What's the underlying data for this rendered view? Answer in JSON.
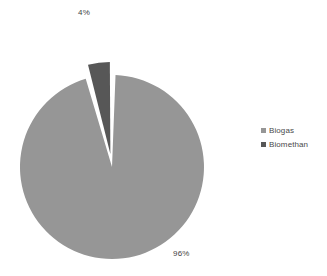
{
  "chart_data": {
    "type": "pie",
    "title": "",
    "categories": [
      "Biogas",
      "Biomethan"
    ],
    "values": [
      96,
      4
    ],
    "value_unit": "%",
    "data_labels": [
      "96%",
      "4%"
    ],
    "colors": [
      "#969696",
      "#575757"
    ],
    "legend_position": "right",
    "grid": false,
    "exploded_slices": [
      "Biomethan"
    ],
    "start_angle_deg": 0,
    "direction": "clockwise"
  },
  "labels": {
    "biomethan_pct": "4%",
    "biogas_pct": "96%"
  },
  "legend": {
    "items": [
      {
        "label": "Biogas",
        "color": "#969696"
      },
      {
        "label": "Biomethan",
        "color": "#575757"
      }
    ]
  },
  "colors": {
    "biogas": "#969696",
    "biomethan": "#575757",
    "background": "#ffffff",
    "label_text": "#3f3f3f",
    "legend_text": "#4a4a4a"
  }
}
